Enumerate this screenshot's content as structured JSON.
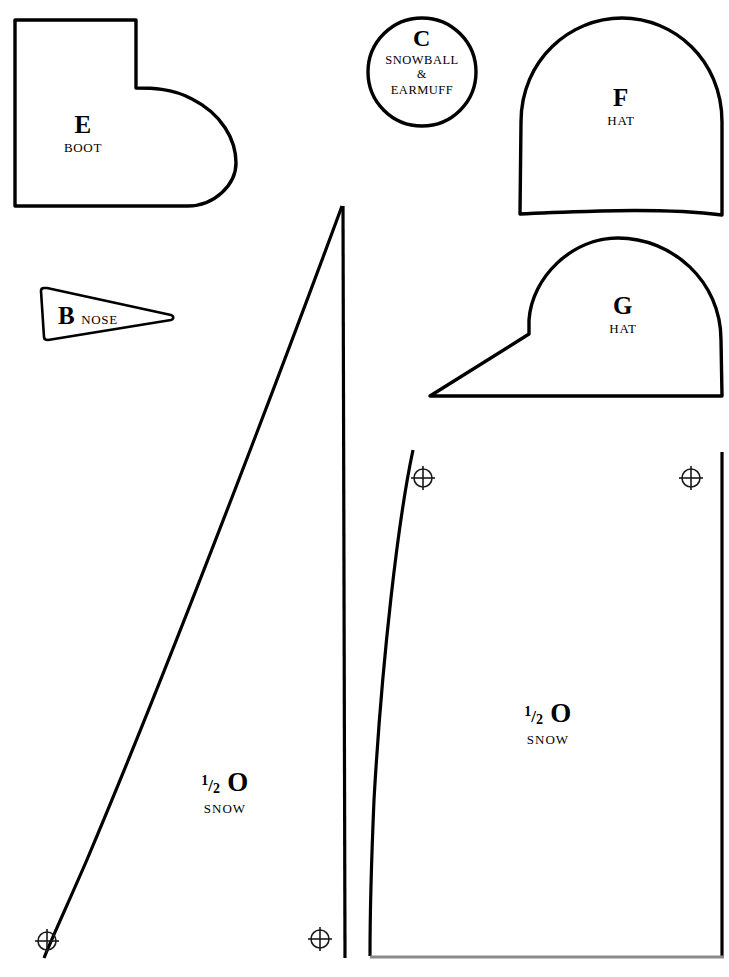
{
  "page": {
    "background_color": "#ffffff",
    "ink_color": "#000000",
    "trim_line_color": "#8a8a8a",
    "width": 729,
    "height": 977
  },
  "pieces": [
    {
      "id": "piece-e-boot",
      "code": "E",
      "description": "BOOT",
      "shape": "boot"
    },
    {
      "id": "piece-b-nose",
      "code": "B",
      "description": "NOSE",
      "shape": "triangle"
    },
    {
      "id": "piece-c-snowball-earmuff",
      "code": "C",
      "description_line1": "SNOWBALL",
      "description_line2": "&",
      "description_line3": "EARMUFF",
      "shape": "circle"
    },
    {
      "id": "piece-f-hat",
      "code": "F",
      "description": "HAT",
      "shape": "dome"
    },
    {
      "id": "piece-g-hat",
      "code": "G",
      "description": "HAT",
      "shape": "dome-with-brim"
    },
    {
      "id": "piece-o-snow-left",
      "code": "O",
      "fraction_numerator": "1",
      "fraction_slash": "/",
      "fraction_denominator": "2",
      "description": "SNOW",
      "shape": "tall-curved-wedge"
    },
    {
      "id": "piece-o-snow-right",
      "code": "O",
      "fraction_numerator": "1",
      "fraction_slash": "/",
      "fraction_denominator": "2",
      "description": "SNOW",
      "shape": "tall-curved-panel"
    }
  ],
  "registration_marks": [
    {
      "name": "registration-mark-bottom-left",
      "x": 47,
      "y": 941
    },
    {
      "name": "registration-mark-bottom-middle",
      "x": 320,
      "y": 939
    },
    {
      "name": "registration-mark-top-left",
      "x": 423,
      "y": 478
    },
    {
      "name": "registration-mark-top-right",
      "x": 691,
      "y": 478
    }
  ]
}
